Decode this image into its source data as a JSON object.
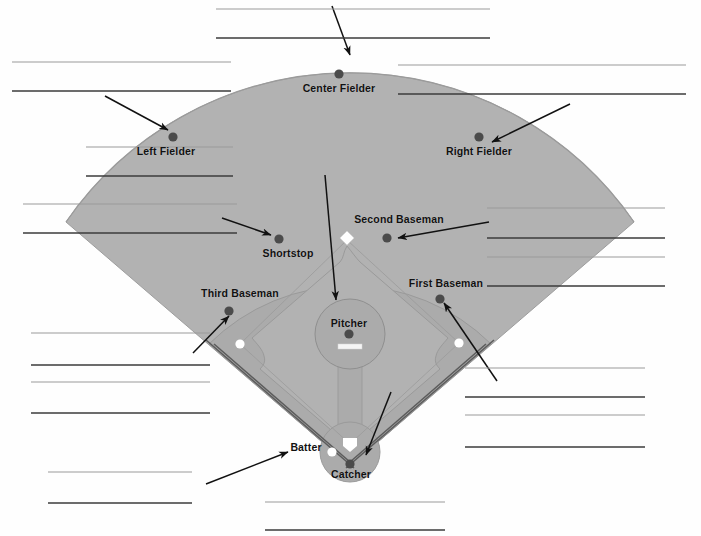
{
  "worksheet": {
    "title": "Baseball Field Positions Labeling Worksheet",
    "type": "diagram",
    "background_color": "#fefefe"
  },
  "diagram": {
    "name": "baseball-field",
    "field_color": "#b0b0b0",
    "infield_dirt_color": "#a8a8a8",
    "line_color": "#8a8a8a",
    "player_marker_color": "#4a4a4a",
    "base_marker_color": "#ffffff",
    "arrow_color": "#111111",
    "apex": {
      "x": 350,
      "y": 466
    },
    "outfield_radius": 330
  },
  "positions": [
    {
      "id": "center-fielder",
      "label": "Center Fielder",
      "marker_x": 339,
      "marker_y": 74,
      "label_x": 339,
      "label_y": 82
    },
    {
      "id": "left-fielder",
      "label": "Left Fielder",
      "marker_x": 173,
      "marker_y": 137,
      "label_x": 166,
      "label_y": 145
    },
    {
      "id": "right-fielder",
      "label": "Right Fielder",
      "marker_x": 479,
      "marker_y": 137,
      "label_x": 479,
      "label_y": 145
    },
    {
      "id": "shortstop",
      "label": "Shortstop",
      "marker_x": 279,
      "marker_y": 239,
      "label_x": 288,
      "label_y": 247
    },
    {
      "id": "second-baseman",
      "label": "Second Baseman",
      "marker_x": 387,
      "marker_y": 238,
      "label_x": 399,
      "label_y": 213
    },
    {
      "id": "third-baseman",
      "label": "Third Baseman",
      "marker_x": 229,
      "marker_y": 311,
      "label_x": 240,
      "label_y": 287
    },
    {
      "id": "first-baseman",
      "label": "First Baseman",
      "marker_x": 440,
      "marker_y": 299,
      "label_x": 446,
      "label_y": 277
    },
    {
      "id": "pitcher",
      "label": "Pitcher",
      "marker_x": 349,
      "marker_y": 334,
      "label_x": 349,
      "label_y": 317
    },
    {
      "id": "catcher",
      "label": "Catcher",
      "marker_x": 350,
      "marker_y": 464,
      "label_x": 351,
      "label_y": 468
    },
    {
      "id": "batter",
      "label": "Batter",
      "marker_x": 333,
      "marker_y": 453,
      "label_x": 306,
      "label_y": 441
    }
  ],
  "bases": [
    {
      "id": "second-base",
      "x": 347,
      "y": 238,
      "shape": "diamond"
    },
    {
      "id": "third-base",
      "x": 240,
      "y": 344,
      "shape": "circle"
    },
    {
      "id": "first-base",
      "x": 459,
      "y": 343,
      "shape": "circle"
    },
    {
      "id": "home-plate",
      "x": 350,
      "y": 444,
      "shape": "pentagon"
    },
    {
      "id": "batter-box-marker",
      "x": 333,
      "y": 452,
      "shape": "circle"
    }
  ],
  "arrows": [
    {
      "id": "arrow-center-fielder",
      "x1": 332,
      "y1": 6,
      "x2": 350,
      "y2": 55
    },
    {
      "id": "arrow-left-fielder",
      "x1": 105,
      "y1": 96,
      "x2": 168,
      "y2": 130
    },
    {
      "id": "arrow-right-fielder",
      "x1": 570,
      "y1": 104,
      "x2": 493,
      "y2": 143
    },
    {
      "id": "arrow-shortstop",
      "x1": 222,
      "y1": 218,
      "x2": 272,
      "y2": 235
    },
    {
      "id": "arrow-second-baseman",
      "x1": 489,
      "y1": 222,
      "x2": 398,
      "y2": 238
    },
    {
      "id": "arrow-third-baseman",
      "x1": 193,
      "y1": 353,
      "x2": 229,
      "y2": 315
    },
    {
      "id": "arrow-first-baseman",
      "x1": 497,
      "y1": 381,
      "x2": 443,
      "y2": 302
    },
    {
      "id": "arrow-pitcher",
      "x1": 325,
      "y1": 175,
      "x2": 336,
      "y2": 300
    },
    {
      "id": "arrow-batter",
      "x1": 206,
      "y1": 484,
      "x2": 288,
      "y2": 452
    },
    {
      "id": "arrow-catcher",
      "x1": 391,
      "y1": 392,
      "x2": 365,
      "y2": 457
    }
  ],
  "answer_lines": [
    {
      "id": "line-center-1",
      "x": 216,
      "y": 9,
      "width": 274,
      "weight": "light"
    },
    {
      "id": "line-center-2",
      "x": 216,
      "y": 38,
      "width": 274,
      "weight": "dark"
    },
    {
      "id": "line-left-1",
      "x": 12,
      "y": 62,
      "width": 219,
      "weight": "light"
    },
    {
      "id": "line-left-2",
      "x": 12,
      "y": 91,
      "width": 219,
      "weight": "dark"
    },
    {
      "id": "line-right-1",
      "x": 398,
      "y": 65,
      "width": 288,
      "weight": "light"
    },
    {
      "id": "line-right-2",
      "x": 398,
      "y": 94,
      "width": 288,
      "weight": "dark"
    },
    {
      "id": "line-upleft-1",
      "x": 86,
      "y": 147,
      "width": 147,
      "weight": "light"
    },
    {
      "id": "line-upleft-2",
      "x": 86,
      "y": 176,
      "width": 147,
      "weight": "dark"
    },
    {
      "id": "line-midleft-1",
      "x": 23,
      "y": 204,
      "width": 214,
      "weight": "light"
    },
    {
      "id": "line-midleft-2",
      "x": 23,
      "y": 233,
      "width": 214,
      "weight": "dark"
    },
    {
      "id": "line-midright-1",
      "x": 487,
      "y": 208,
      "width": 178,
      "weight": "light"
    },
    {
      "id": "line-midright-2",
      "x": 487,
      "y": 238,
      "width": 178,
      "weight": "dark"
    },
    {
      "id": "line-midright-3",
      "x": 487,
      "y": 257,
      "width": 178,
      "weight": "light"
    },
    {
      "id": "line-midright-4",
      "x": 487,
      "y": 286,
      "width": 178,
      "weight": "dark"
    },
    {
      "id": "line-lowleft-1",
      "x": 31,
      "y": 333,
      "width": 179,
      "weight": "light"
    },
    {
      "id": "line-lowleft-2",
      "x": 31,
      "y": 365,
      "width": 179,
      "weight": "dark"
    },
    {
      "id": "line-lowleft-3",
      "x": 31,
      "y": 382,
      "width": 179,
      "weight": "light"
    },
    {
      "id": "line-lowleft-4",
      "x": 31,
      "y": 413,
      "width": 179,
      "weight": "dark"
    },
    {
      "id": "line-lowright-1",
      "x": 465,
      "y": 368,
      "width": 180,
      "weight": "light"
    },
    {
      "id": "line-lowright-2",
      "x": 465,
      "y": 397,
      "width": 180,
      "weight": "dark"
    },
    {
      "id": "line-lowright-3",
      "x": 465,
      "y": 415,
      "width": 180,
      "weight": "light"
    },
    {
      "id": "line-lowright-4",
      "x": 465,
      "y": 447,
      "width": 180,
      "weight": "dark"
    },
    {
      "id": "line-botleft-1",
      "x": 48,
      "y": 472,
      "width": 144,
      "weight": "light"
    },
    {
      "id": "line-botleft-2",
      "x": 48,
      "y": 503,
      "width": 144,
      "weight": "dark"
    },
    {
      "id": "line-bottom-1",
      "x": 265,
      "y": 502,
      "width": 180,
      "weight": "light"
    },
    {
      "id": "line-bottom-2",
      "x": 265,
      "y": 530,
      "width": 180,
      "weight": "dark"
    }
  ],
  "chart_data": {
    "type": "diagram",
    "labels": [
      "Center Fielder",
      "Left Fielder",
      "Right Fielder",
      "Shortstop",
      "Second Baseman",
      "Third Baseman",
      "First Baseman",
      "Pitcher",
      "Catcher",
      "Batter"
    ]
  }
}
